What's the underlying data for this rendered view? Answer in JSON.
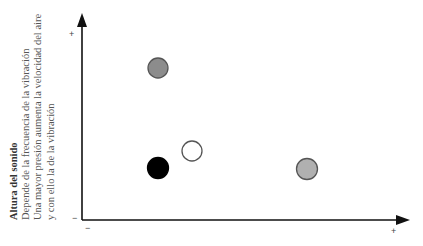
{
  "y_axis": {
    "title": "Altura del sonido",
    "lines": [
      "Depende de la frecuencia de la vibración",
      "Una mayor presión aumenta la velocidad del aire",
      "y con ello la de la vibración"
    ],
    "top_label": "+",
    "bottom_label": "−"
  },
  "x_axis": {
    "left_label": "−",
    "right_label": "+",
    "title_cutoff": ""
  },
  "points": [
    {
      "name": "gray-point-top",
      "cx": 158,
      "cy": 68,
      "r": 10,
      "fill": "#8c8c8c",
      "stroke": "#555555"
    },
    {
      "name": "black-point",
      "cx": 158,
      "cy": 168,
      "r": 10.5,
      "fill": "#000000",
      "stroke": "#000000"
    },
    {
      "name": "white-point",
      "cx": 192,
      "cy": 151,
      "r": 10,
      "fill": "#ffffff",
      "stroke": "#555555"
    },
    {
      "name": "gray-point-right",
      "cx": 307,
      "cy": 169,
      "r": 10.5,
      "fill": "#b0b0b0",
      "stroke": "#555555"
    }
  ],
  "colors": {
    "axis": "#111111"
  }
}
